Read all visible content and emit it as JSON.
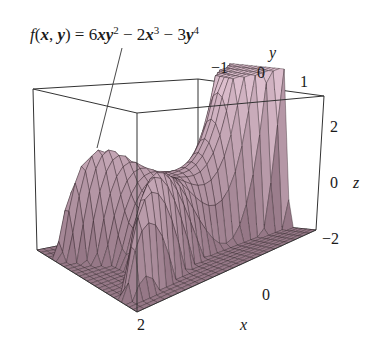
{
  "chart_data": {
    "type": "surface3d",
    "function": "6*x*y^2 - 2*x^3 - 3*y^4",
    "xlabel": "x",
    "ylabel": "y",
    "zlabel": "z",
    "x_ticks": [
      "0",
      "2"
    ],
    "y_ticks": [
      "−1",
      "0",
      "1"
    ],
    "z_ticks": [
      "2",
      "0",
      "−2"
    ],
    "xlim": [
      -2,
      2
    ],
    "ylim": [
      -2,
      2
    ],
    "zlim": [
      -3,
      3
    ],
    "grid": false,
    "surface_color": "#c9b4bd",
    "mesh_color": "#2a1e24",
    "box_color": "#333333",
    "annotation": "leader line from formula label to surface"
  },
  "labels": {
    "formula": {
      "f": "f",
      "open": "(",
      "x": "x",
      "comma": ", ",
      "y": "y",
      "close": ") = 6",
      "xy": "xy",
      "pow2": "2",
      "minus1": " − 2",
      "x2": "x",
      "pow3": "3",
      "minus2": " − 3",
      "y2": "y",
      "pow4": "4"
    },
    "y_axis": {
      "name": "y",
      "tick_neg1": "−1",
      "tick_0": "0",
      "tick_1": "1"
    },
    "z_axis": {
      "name": "z",
      "tick_2": "2",
      "tick_0": "0",
      "tick_neg2": "−2"
    },
    "x_axis": {
      "name": "x",
      "tick_0": "0",
      "tick_2": "2"
    }
  }
}
